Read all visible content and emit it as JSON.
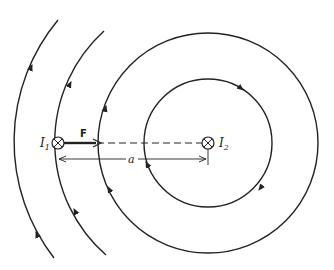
{
  "diagram": {
    "labels": {
      "current1": "I",
      "current1_sub": "1",
      "current2": "I",
      "current2_sub": "2",
      "force": "F",
      "separation": "a"
    },
    "wires": [
      {
        "name": "I1",
        "x": 58,
        "y": 143,
        "symbol": "into-page (⊗)"
      },
      {
        "name": "I2",
        "x": 208,
        "y": 143,
        "symbol": "into-page (⊗)"
      }
    ],
    "field_lines": [
      {
        "radius": 64,
        "type": "full-circle",
        "direction": "clockwise"
      },
      {
        "radius": 110,
        "type": "full-circle",
        "direction": "clockwise"
      },
      {
        "radius": 150,
        "type": "arc",
        "direction": "clockwise"
      },
      {
        "radius": 190,
        "type": "arc",
        "direction": "clockwise"
      }
    ],
    "colors": {
      "line": "#222222",
      "background": "#ffffff"
    }
  }
}
